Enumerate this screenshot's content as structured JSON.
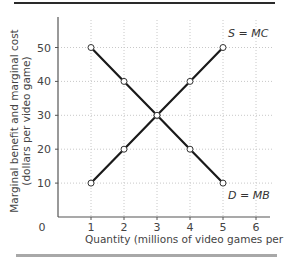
{
  "chart_data": {
    "type": "line",
    "title": "",
    "xlabel": "Quantity (millions of video games per year)",
    "ylabel_line1": "Marginal benefit and marginal cost",
    "ylabel_line2": "(dollars per video game)",
    "xlim": [
      0,
      6
    ],
    "ylim": [
      0,
      55
    ],
    "x_ticks": [
      0,
      1,
      2,
      3,
      4,
      5,
      6
    ],
    "y_ticks": [
      10,
      20,
      30,
      40,
      50
    ],
    "origin_label": "0",
    "grid": true,
    "series": [
      {
        "name": "S = MC",
        "x": [
          1,
          2,
          3,
          4,
          5
        ],
        "values": [
          10,
          20,
          30,
          40,
          50
        ]
      },
      {
        "name": "D = MB",
        "x": [
          1,
          2,
          3,
          4,
          5
        ],
        "values": [
          50,
          40,
          30,
          20,
          10
        ]
      }
    ],
    "annotations": [
      {
        "text": "S = MC",
        "x": 5,
        "y": 50,
        "position": "above-right"
      },
      {
        "text": "D = MB",
        "x": 5,
        "y": 10,
        "position": "below-right"
      }
    ]
  },
  "colors": {
    "line": "#1a1a1a",
    "grid": "#c8c8c8",
    "axis": "#555555",
    "marker_fill": "#ffffff"
  }
}
